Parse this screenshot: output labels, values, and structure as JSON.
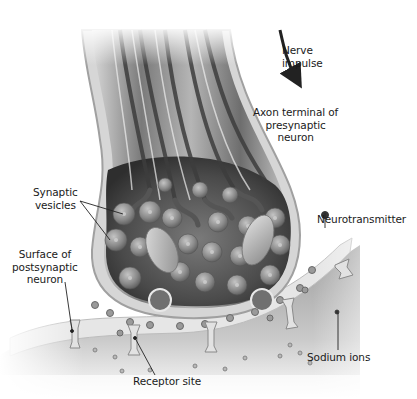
{
  "diagram": {
    "type": "anatomical illustration",
    "color_scheme": "grayscale",
    "colors": {
      "background": "#ffffff",
      "axon_fill": "#9a9a9a",
      "axon_dark": "#4a4a4a",
      "membrane": "#dcdcdc",
      "terminal_interior": "#3a3a3a",
      "vesicle": "#8c8c8c",
      "postsynaptic_body": "#a8a8a8",
      "label_text": "#1a1a1a",
      "leader_line": "#222222"
    }
  },
  "labels": {
    "nerve_impulse": "Nerve\nimpulse",
    "axon_terminal": "Axon terminal of\npresynaptic\nneuron",
    "synaptic_vesicles": "Synaptic\nvesicles",
    "neurotransmitter": "Neurotransmitter",
    "surface_postsynaptic": "Surface of\npostsynaptic\nneuron",
    "sodium_ions": "Sodium ions",
    "receptor_site": "Receptor site"
  },
  "annotations": {
    "arrow": "nerve-impulse-direction-arrow"
  }
}
